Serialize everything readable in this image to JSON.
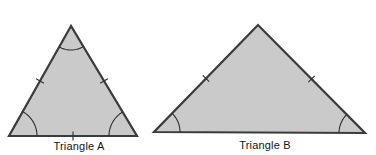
{
  "figure": {
    "background_color": "#ffffff",
    "shape_fill_color": "#cacaca",
    "shape_stroke_color": "#3b3b3b",
    "mark_color": "#2e2e2e",
    "triangles": [
      {
        "id": "triangle-a",
        "label": "Triangle A",
        "vertices": [
          [
            71,
            26
          ],
          [
            9,
            136
          ],
          [
            137,
            136
          ]
        ],
        "angle_arcs": [
          {
            "vertex": 0,
            "radius": 24
          },
          {
            "vertex": 1,
            "radius": 28
          },
          {
            "vertex": 2,
            "radius": 28
          }
        ],
        "side_ticks": [
          {
            "from": 0,
            "to": 1
          },
          {
            "from": 0,
            "to": 2
          },
          {
            "from": 1,
            "to": 2
          }
        ],
        "label_center": [
          79,
          146
        ]
      },
      {
        "id": "triangle-b",
        "label": "Triangle B",
        "vertices": [
          [
            258,
            25
          ],
          [
            154,
            132
          ],
          [
            365,
            133
          ]
        ],
        "angle_arcs": [
          {
            "vertex": 1,
            "radius": 26
          },
          {
            "vertex": 2,
            "radius": 26
          }
        ],
        "side_ticks": [
          {
            "from": 0,
            "to": 1
          },
          {
            "from": 0,
            "to": 2
          }
        ],
        "label_center": [
          265,
          145
        ]
      }
    ]
  }
}
